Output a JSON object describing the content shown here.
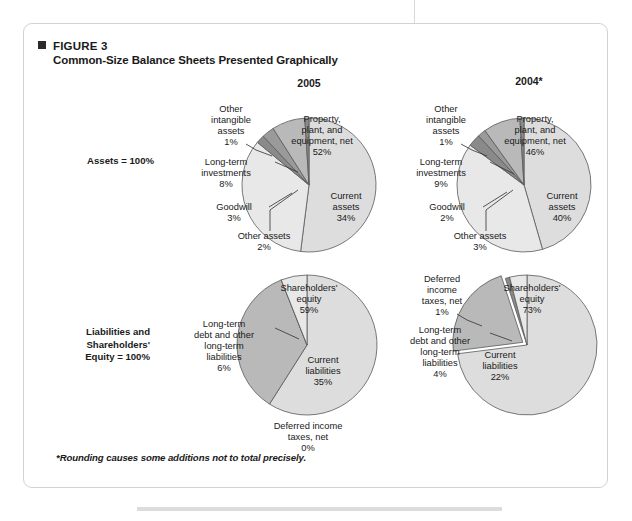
{
  "figure": {
    "marker_icon": "square-bullet-icon",
    "label": "FIGURE 3",
    "title": "Common-Size Balance Sheets Presented Graphically",
    "footnote": "*Rounding causes some additions not to total precisely."
  },
  "columns": [
    {
      "id": "col-2005",
      "heading": "2005"
    },
    {
      "id": "col-2004",
      "heading": "2004*"
    }
  ],
  "rows": [
    {
      "id": "row-assets",
      "label": "Assets = 100%"
    },
    {
      "id": "row-liabilities",
      "label": "Liabilities and\nShareholders'\nEquity = 100%"
    }
  ],
  "colors": {
    "slice_light": "#dddddd",
    "slice_pale": "#e8e8e8",
    "slice_mid": "#b9b9b9",
    "slice_dark": "#9a9a9a",
    "slice_darker": "#8a8a8a",
    "outline": "#58595b",
    "card_border": "#d2d2d2",
    "text": "#1a1a1a"
  },
  "chart_data": [
    {
      "id": "assets-2005",
      "type": "pie",
      "title": "Assets = 100%",
      "period": "2005",
      "total_label": "Assets = 100%",
      "categories": [
        "Property, plant, and equipment, net",
        "Current assets",
        "Other assets",
        "Goodwill",
        "Long-term investments",
        "Other intangible assets"
      ],
      "values": [
        52,
        34,
        2,
        3,
        8,
        1
      ],
      "labels": [
        {
          "text": "Property,\nplant, and\nequipment, net\n52%",
          "placement": "inside"
        },
        {
          "text": "Current\nassets\n34%",
          "placement": "inside"
        },
        {
          "text": "Other assets\n2%",
          "placement": "outside"
        },
        {
          "text": "Goodwill\n3%",
          "placement": "outside"
        },
        {
          "text": "Long-term\ninvestments\n8%",
          "placement": "outside"
        },
        {
          "text": "Other\nintangible\nassets\n1%",
          "placement": "outside"
        }
      ]
    },
    {
      "id": "assets-2004",
      "type": "pie",
      "title": "Assets = 100%",
      "period": "2004*",
      "total_label": "Assets = 100%",
      "categories": [
        "Property, plant, and equipment, net",
        "Current assets",
        "Other assets",
        "Goodwill",
        "Long-term investments",
        "Other intangible assets"
      ],
      "values": [
        46,
        40,
        3,
        2,
        9,
        1
      ],
      "labels": [
        {
          "text": "Property,\nplant, and\nequipment, net\n46%",
          "placement": "inside"
        },
        {
          "text": "Current\nassets\n40%",
          "placement": "inside"
        },
        {
          "text": "Other assets\n3%",
          "placement": "outside"
        },
        {
          "text": "Goodwill\n2%",
          "placement": "outside"
        },
        {
          "text": "Long-term\ninvestments\n9%",
          "placement": "outside"
        },
        {
          "text": "Other\nintangible\nassets\n1%",
          "placement": "outside"
        }
      ]
    },
    {
      "id": "liabilities-equity-2005",
      "type": "pie",
      "title": "Liabilities and Shareholders' Equity = 100%",
      "period": "2005",
      "total_label": "Liabilities and Shareholders' Equity = 100%",
      "categories": [
        "Shareholders' equity",
        "Current liabilities",
        "Deferred income taxes, net",
        "Long-term debt and other long-term liabilities"
      ],
      "values": [
        59,
        35,
        0,
        6
      ],
      "labels": [
        {
          "text": "Shareholders'\nequity\n59%",
          "placement": "inside"
        },
        {
          "text": "Current\nliabilities\n35%",
          "placement": "inside"
        },
        {
          "text": "Deferred income\ntaxes, net\n0%",
          "placement": "outside"
        },
        {
          "text": "Long-term\ndebt and other\nlong-term\nliabilities\n6%",
          "placement": "outside"
        }
      ]
    },
    {
      "id": "liabilities-equity-2004",
      "type": "pie",
      "title": "Liabilities and Shareholders' Equity = 100%",
      "period": "2004*",
      "total_label": "Liabilities and Shareholders' Equity = 100%",
      "categories": [
        "Shareholders' equity",
        "Current liabilities",
        "Deferred income taxes, net",
        "Long-term debt and other long-term liabilities"
      ],
      "values": [
        73,
        22,
        1,
        4
      ],
      "labels": [
        {
          "text": "Shareholders'\nequity\n73%",
          "placement": "inside"
        },
        {
          "text": "Current\nliabilities\n22%",
          "placement": "inside"
        },
        {
          "text": "Deferred\nincome\ntaxes, net\n1%",
          "placement": "outside"
        },
        {
          "text": "Long-term\ndebt and other\nlong-term\nliabilities\n4%",
          "placement": "outside"
        }
      ]
    }
  ]
}
